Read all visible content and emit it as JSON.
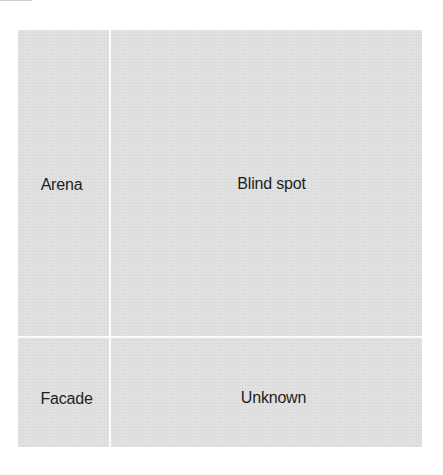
{
  "diagram": {
    "type": "2x2 matrix",
    "quadrants": [
      {
        "id": "top-left",
        "label": "Arena"
      },
      {
        "id": "top-right",
        "label": "Blind spot"
      },
      {
        "id": "bottom-left",
        "label": "Facade"
      },
      {
        "id": "bottom-right",
        "label": "Unknown"
      }
    ],
    "colors": {
      "cell_fill": "#dedede",
      "divider": "#fbfbfb",
      "text": "#1e1e1e",
      "background": "#ffffff"
    }
  }
}
